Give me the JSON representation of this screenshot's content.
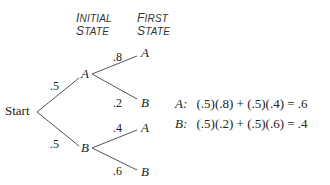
{
  "headers": {
    "initial_state": {
      "line1_cap": "I",
      "line1_rest": "NITIAL",
      "line2_cap": "S",
      "line2_rest": "TATE"
    },
    "first_state": {
      "line1_cap": "F",
      "line1_rest": "IRST",
      "line2_cap": "S",
      "line2_rest": "TATE"
    }
  },
  "tree": {
    "root": "Start",
    "initial": [
      {
        "label": "A",
        "prob": ".5",
        "children": [
          {
            "label": "A",
            "prob": ".8"
          },
          {
            "label": "B",
            "prob": ".2"
          }
        ]
      },
      {
        "label": "B",
        "prob": ".5",
        "children": [
          {
            "label": "A",
            "prob": ".4"
          },
          {
            "label": "B",
            "prob": ".6"
          }
        ]
      }
    ]
  },
  "equations": [
    {
      "state": "A:",
      "expr": "(.5)(.8) + (.5)(.4) = .6"
    },
    {
      "state": "B:",
      "expr": "(.5)(.2) + (.5)(.6) = .4"
    }
  ],
  "colors": {
    "line": "#555555",
    "text": "#222222"
  }
}
